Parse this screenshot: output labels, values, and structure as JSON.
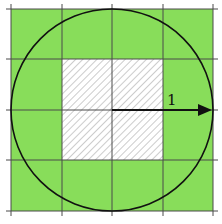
{
  "diagram": {
    "colors": {
      "fill": "#88dd5a",
      "grid": "#4a4a4a",
      "circle": "#111111",
      "hatch": "#9a9a9a",
      "hatch_bg": "#ffffff"
    },
    "grid": {
      "cols": 4,
      "rows": 4
    },
    "radius_label": "1"
  }
}
